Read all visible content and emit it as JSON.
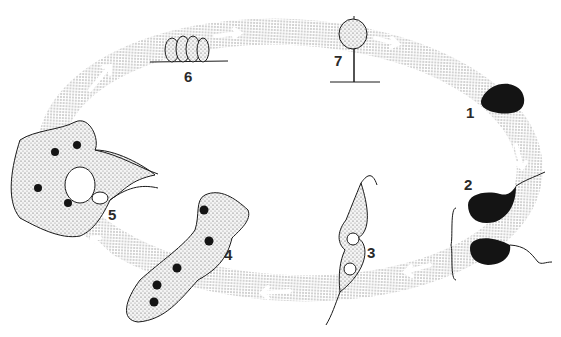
{
  "diagram": {
    "type": "life-cycle",
    "colors": {
      "ink": "#1a1a1a",
      "cycle_band": "#c8c8c8",
      "stipple": "#d6d6d6",
      "background": "#ffffff"
    },
    "stages": [
      {
        "id": 1,
        "label": "1",
        "description": "dark rounded spore/cell"
      },
      {
        "id": 2,
        "label": "2",
        "description": "two dark flagellated swarm cells (bracketed)"
      },
      {
        "id": 3,
        "label": "3",
        "description": "fusing flagellated cells with two nuclei"
      },
      {
        "id": 4,
        "label": "4",
        "description": "elongated stippled plasmodium with five nuclei"
      },
      {
        "id": 5,
        "label": "5",
        "description": "branched reticulate plasmodium with nuclei"
      },
      {
        "id": 6,
        "label": "6",
        "description": "cluster of four sporangia on substrate"
      },
      {
        "id": 7,
        "label": "7",
        "description": "stalked round sporangium on substrate"
      }
    ]
  }
}
